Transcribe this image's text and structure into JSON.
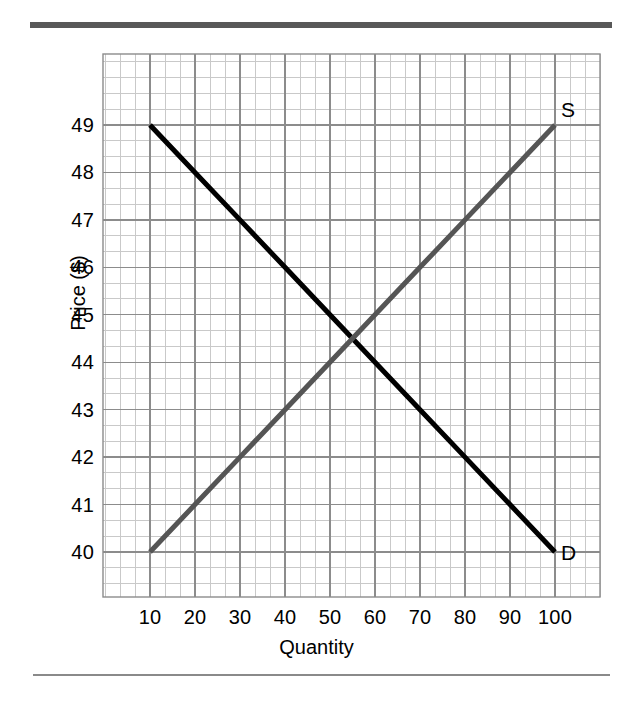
{
  "figure": {
    "background_color": "#ffffff",
    "top_rule_color": "#585858",
    "bottom_rule_color": "#8a8a8a"
  },
  "chart_data": {
    "type": "line",
    "title": "",
    "subtitle": "",
    "xlabel": "Quantity",
    "ylabel": "Price ($)",
    "xlim": [
      5,
      105
    ],
    "ylim": [
      39.5,
      49.9
    ],
    "xticks": [
      10,
      20,
      30,
      40,
      50,
      60,
      70,
      80,
      90,
      100
    ],
    "xticklabels": [
      "10",
      "20",
      "30",
      "40",
      "50",
      "60",
      "70",
      "80",
      "90",
      "100"
    ],
    "yticks": [
      40,
      41,
      42,
      43,
      44,
      45,
      46,
      47,
      48,
      49
    ],
    "yticklabels": [
      "40",
      "41",
      "42",
      "43",
      "44",
      "45",
      "46",
      "47",
      "48",
      "49"
    ],
    "grid": true,
    "grid_major_color": "#8c8c8c",
    "grid_minor_color": "#c9c9c9",
    "minor_divisions_per_major_x": 3,
    "minor_divisions_per_major_y": 3,
    "legend": "inline-endpoint-labels",
    "series": [
      {
        "name": "D",
        "label": "D",
        "role": "demand",
        "color": "#000000",
        "linewidth": 5,
        "x": [
          10,
          100
        ],
        "y": [
          49,
          40
        ],
        "points": [
          [
            10,
            49
          ],
          [
            20,
            48
          ],
          [
            30,
            47
          ],
          [
            40,
            46
          ],
          [
            50,
            45
          ],
          [
            60,
            44
          ],
          [
            70,
            43
          ],
          [
            80,
            42
          ],
          [
            90,
            41
          ],
          [
            100,
            40
          ]
        ]
      },
      {
        "name": "S",
        "label": "S",
        "role": "supply",
        "color": "#555555",
        "linewidth": 5,
        "x": [
          10,
          100
        ],
        "y": [
          40,
          49
        ],
        "points": [
          [
            10,
            40
          ],
          [
            20,
            41
          ],
          [
            30,
            42
          ],
          [
            40,
            43
          ],
          [
            50,
            44
          ],
          [
            60,
            45
          ],
          [
            70,
            46
          ],
          [
            80,
            47
          ],
          [
            90,
            48
          ],
          [
            100,
            49
          ]
        ]
      }
    ],
    "annotations": [
      {
        "name": "equilibrium",
        "x": 55,
        "y": 44.5,
        "text": ""
      }
    ]
  }
}
